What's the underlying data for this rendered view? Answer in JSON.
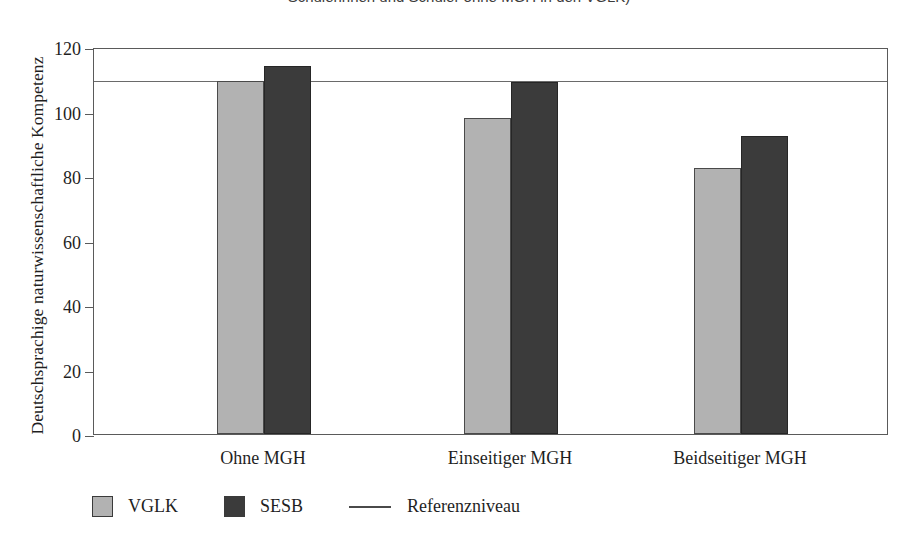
{
  "caption": {
    "text": "Schülerinnen und Schüler ohne MGH in den VGLK)"
  },
  "chart_data": {
    "type": "bar",
    "title": "",
    "xlabel": "",
    "ylabel": "Deutschsprachige naturwissenschaftliche Kompetenz",
    "categories": [
      "Ohne MGH",
      "Einseitiger MGH",
      "Beidseitiger MGH"
    ],
    "series": [
      {
        "name": "VGLK",
        "color": "#b2b2b2",
        "values": [
          109.5,
          98,
          82.5
        ]
      },
      {
        "name": "SESB",
        "color": "#3b3b3b",
        "values": [
          114,
          109,
          92.5
        ]
      }
    ],
    "reference_line": {
      "label": "Referenzniveau",
      "value": 110,
      "color": "#6a6a6a"
    },
    "ylim": [
      0,
      120
    ],
    "yticks": [
      0,
      20,
      40,
      60,
      80,
      100,
      120
    ],
    "ytick_labels": [
      "0",
      "20",
      "40",
      "60",
      "80",
      "100",
      "120"
    ],
    "grid": false,
    "legend_position": "bottom-left"
  },
  "legend": {
    "items": [
      {
        "label": "VGLK",
        "marker": "swatch-light"
      },
      {
        "label": "SESB",
        "marker": "swatch-dark"
      },
      {
        "label": "Referenzniveau",
        "marker": "line"
      }
    ]
  }
}
